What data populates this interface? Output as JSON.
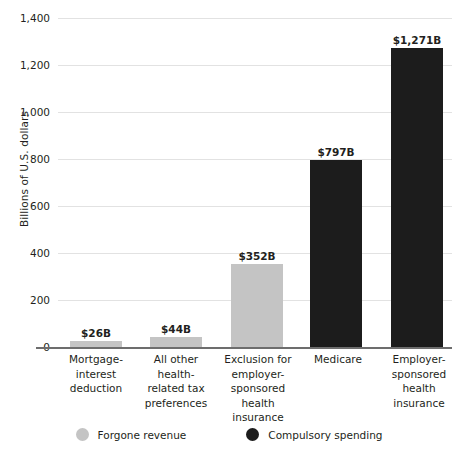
{
  "chart_data": {
    "type": "bar",
    "title": "",
    "xlabel": "",
    "ylabel": "Billions of U.S. dollars",
    "ylim": [
      0,
      1400
    ],
    "grid": true,
    "legend_position": "bottom",
    "categories": [
      "Mortgage-interest deduction",
      "All other health-related tax preferences",
      "Exclusion for employer-sponsored health insurance",
      "Medicare",
      "Employer-sponsored health insurance"
    ],
    "values": [
      26,
      44,
      352,
      797,
      1271
    ],
    "data_labels": [
      "$26B",
      "$44B",
      "$352B",
      "$797B",
      "$1,271B"
    ],
    "point_series": [
      "Forgone revenue",
      "Forgone revenue",
      "Forgone revenue",
      "Compulsory spending",
      "Compulsory spending"
    ],
    "yticks": [
      0,
      200,
      400,
      600,
      800,
      1000,
      1200,
      1400
    ],
    "ytick_labels": [
      "0",
      "200",
      "400",
      "600",
      "800",
      "1,000",
      "1,200",
      "1,400"
    ],
    "series": [
      {
        "name": "Forgone revenue",
        "color": "#c4c4c4"
      },
      {
        "name": "Compulsory spending",
        "color": "#1c1c1c"
      }
    ]
  },
  "axis": {
    "y_title": "Billions of U.S. dollars"
  },
  "bars": [
    {
      "label_lines": [
        "Mortgage-",
        "interest",
        "deduction"
      ],
      "value_label": "$26B",
      "value": 26,
      "kind": "gray"
    },
    {
      "label_lines": [
        "All other",
        "health-",
        "related tax",
        "preferences"
      ],
      "value_label": "$44B",
      "value": 44,
      "kind": "gray"
    },
    {
      "label_lines": [
        "Exclusion for",
        "employer-",
        "sponsored",
        "health",
        "insurance"
      ],
      "value_label": "$352B",
      "value": 352,
      "kind": "gray"
    },
    {
      "label_lines": [
        "Medicare"
      ],
      "value_label": "$797B",
      "value": 797,
      "kind": "black"
    },
    {
      "label_lines": [
        "Employer-",
        "sponsored",
        "health",
        "insurance"
      ],
      "value_label": "$1,271B",
      "value": 1271,
      "kind": "black"
    }
  ],
  "legend": {
    "items": [
      {
        "label": "Forgone revenue",
        "color": "#c4c4c4"
      },
      {
        "label": "Compulsory spending",
        "color": "#1c1c1c"
      }
    ]
  },
  "colors": {
    "forgone_revenue": "#c4c4c4",
    "compulsory_spending": "#1c1c1c",
    "gridline": "#e2e2e2",
    "axis": "#6d6d6d",
    "text": "#231f20"
  }
}
